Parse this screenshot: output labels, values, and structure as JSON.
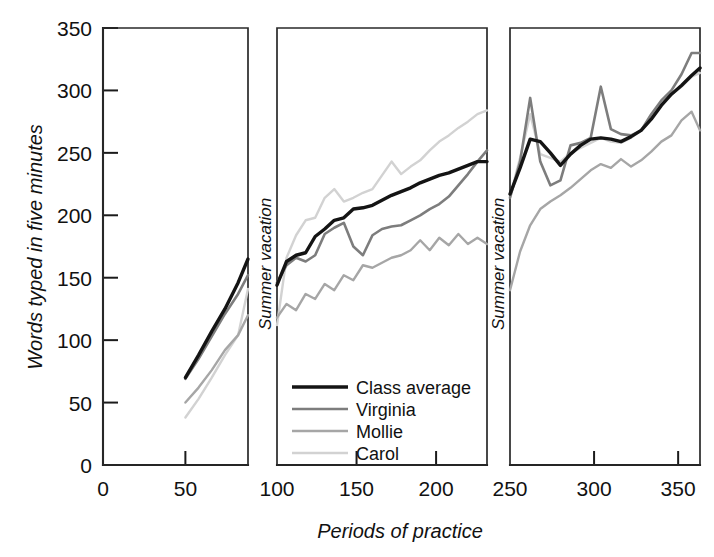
{
  "chart_data": {
    "type": "line",
    "title": "",
    "xlabel": "Periods of practice",
    "ylabel": "Words typed in five minutes",
    "xlim": [
      0,
      365
    ],
    "ylim": [
      0,
      350
    ],
    "yticks": [
      0,
      50,
      100,
      150,
      200,
      250,
      300,
      350
    ],
    "xticks": [
      0,
      50,
      100,
      150,
      200,
      250,
      300,
      350
    ],
    "grid": false,
    "legend_position": "inside-center-bottom",
    "panels": [
      {
        "name": "term-1",
        "x_start": 0,
        "x_end": 88
      },
      {
        "name": "term-2",
        "x_start": 100,
        "x_end": 232
      },
      {
        "name": "term-3",
        "x_start": 250,
        "x_end": 363
      }
    ],
    "annotations": [
      {
        "text": "Summer vacation",
        "at_x": 97,
        "rotation": -90
      },
      {
        "text": "Summer vacation",
        "at_x": 247,
        "rotation": -90
      }
    ],
    "series": [
      {
        "name": "Class average",
        "color": "#141414",
        "width": 3.4,
        "segments": [
          {
            "x": [
              50,
              58,
              66,
              74,
              82,
              88
            ],
            "y": [
              70,
              88,
              107,
              125,
              146,
              165
            ]
          },
          {
            "x": [
              100,
              106,
              112,
              118,
              124,
              130,
              136,
              142,
              148,
              154,
              160,
              166,
              172,
              178,
              184,
              190,
              196,
              202,
              208,
              214,
              220,
              226,
              232
            ],
            "y": [
              144,
              163,
              168,
              170,
              183,
              189,
              196,
              198,
              205,
              206,
              208,
              212,
              216,
              219,
              222,
              226,
              229,
              232,
              234,
              237,
              240,
              243,
              243
            ]
          },
          {
            "x": [
              250,
              256,
              262,
              268,
              274,
              280,
              286,
              292,
              298,
              304,
              310,
              316,
              322,
              328,
              334,
              340,
              346,
              352,
              358,
              363
            ],
            "y": [
              217,
              238,
              261,
              259,
              250,
              240,
              249,
              256,
              261,
              262,
              261,
              259,
              263,
              268,
              277,
              288,
              297,
              304,
              312,
              318
            ]
          }
        ]
      },
      {
        "name": "Virginia",
        "color": "#7d7d7d",
        "width": 2.6,
        "segments": [
          {
            "x": [
              50,
              58,
              66,
              74,
              82,
              88
            ],
            "y": [
              69,
              85,
              103,
              121,
              137,
              152
            ]
          },
          {
            "x": [
              100,
              106,
              112,
              118,
              124,
              130,
              136,
              142,
              148,
              154,
              160,
              166,
              172,
              178,
              184,
              190,
              196,
              202,
              208,
              214,
              220,
              226,
              232
            ],
            "y": [
              146,
              160,
              166,
              163,
              168,
              185,
              190,
              194,
              175,
              168,
              184,
              189,
              191,
              192,
              196,
              200,
              205,
              209,
              215,
              224,
              233,
              243,
              252
            ]
          },
          {
            "x": [
              250,
              256,
              262,
              268,
              274,
              280,
              286,
              292,
              298,
              304,
              310,
              316,
              322,
              328,
              334,
              340,
              346,
              352,
              358,
              363
            ],
            "y": [
              214,
              243,
              294,
              243,
              224,
              228,
              256,
              258,
              262,
              303,
              269,
              265,
              264,
              268,
              281,
              292,
              300,
              313,
              330,
              330
            ]
          }
        ]
      },
      {
        "name": "Mollie",
        "color": "#a6a6a6",
        "width": 2.4,
        "segments": [
          {
            "x": [
              50,
              58,
              66,
              74,
              82,
              88
            ],
            "y": [
              50,
              62,
              76,
              92,
              104,
              120
            ]
          },
          {
            "x": [
              100,
              106,
              112,
              118,
              124,
              130,
              136,
              142,
              148,
              154,
              160,
              166,
              172,
              178,
              184,
              190,
              196,
              202,
              208,
              214,
              220,
              226,
              232
            ],
            "y": [
              118,
              129,
              124,
              137,
              133,
              145,
              140,
              152,
              148,
              160,
              158,
              162,
              166,
              168,
              172,
              180,
              172,
              182,
              176,
              185,
              177,
              182,
              177
            ]
          },
          {
            "x": [
              250,
              256,
              262,
              268,
              274,
              280,
              286,
              292,
              298,
              304,
              310,
              316,
              322,
              328,
              334,
              340,
              346,
              352,
              358,
              363
            ],
            "y": [
              140,
              171,
              192,
              205,
              211,
              216,
              222,
              229,
              236,
              241,
              238,
              245,
              239,
              244,
              251,
              259,
              264,
              276,
              283,
              268
            ]
          }
        ]
      },
      {
        "name": "Carol",
        "color": "#d2d2d2",
        "width": 2.4,
        "segments": [
          {
            "x": [
              50,
              58,
              66,
              74,
              82,
              88
            ],
            "y": [
              38,
              53,
              70,
              88,
              104,
              141
            ]
          },
          {
            "x": [
              100,
              106,
              112,
              118,
              124,
              130,
              136,
              142,
              148,
              154,
              160,
              166,
              172,
              178,
              184,
              190,
              196,
              202,
              208,
              214,
              220,
              226,
              232
            ],
            "y": [
              112,
              166,
              184,
              196,
              198,
              214,
              221,
              211,
              214,
              218,
              221,
              232,
              243,
              233,
              239,
              244,
              252,
              259,
              264,
              270,
              275,
              281,
              284
            ]
          },
          {
            "x": [
              250,
              256,
              262,
              268,
              274,
              280,
              286,
              292,
              298,
              304,
              310,
              316,
              322,
              328,
              334,
              340,
              346,
              352,
              358,
              363
            ],
            "y": [
              215,
              246,
              281,
              249,
              246,
              243,
              250,
              254,
              258,
              262,
              259,
              258,
              262,
              268,
              278,
              289,
              297,
              303,
              311,
              314
            ]
          }
        ]
      }
    ]
  },
  "legend": {
    "items": [
      {
        "label": "Class average",
        "color": "#141414",
        "width": 3.4
      },
      {
        "label": "Virginia",
        "color": "#7d7d7d",
        "width": 2.6
      },
      {
        "label": "Mollie",
        "color": "#a6a6a6",
        "width": 2.4
      },
      {
        "label": "Carol",
        "color": "#d2d2d2",
        "width": 2.4
      }
    ]
  },
  "axes": {
    "y_label": "Words typed in five minutes",
    "x_label": "Periods of practice",
    "y_tick_labels": [
      "0",
      "50",
      "100",
      "150",
      "200",
      "250",
      "300",
      "350"
    ],
    "x_tick_labels": [
      "0",
      "50",
      "100",
      "150",
      "200",
      "250",
      "300",
      "350"
    ]
  },
  "annotations": {
    "vacation_1": "Summer vacation",
    "vacation_2": "Summer vacation"
  }
}
